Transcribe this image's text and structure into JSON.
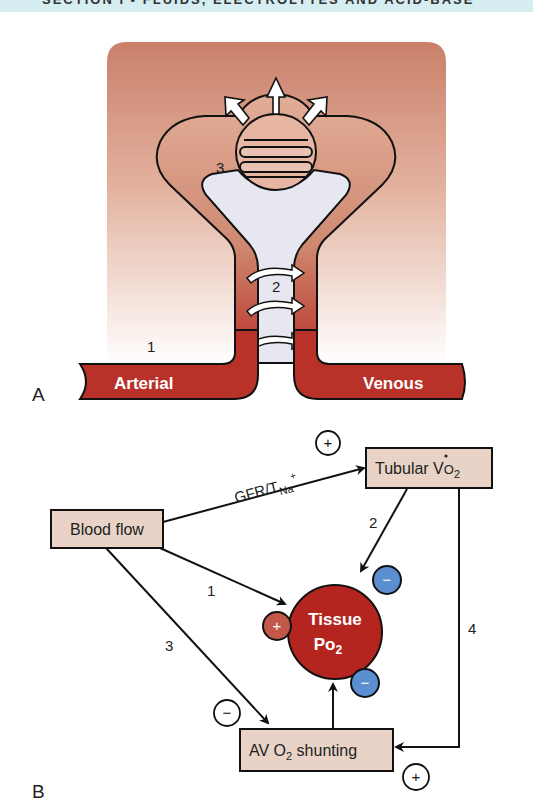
{
  "header": {
    "text": "SECTION I   •   FLUIDS, ELECTROLYTES AND ACID-BASE"
  },
  "panel_a": {
    "label": "A",
    "numbers": {
      "one": "1",
      "two": "2",
      "three": "3"
    },
    "vessel_labels": {
      "arterial": "Arterial",
      "venous": "Venous"
    },
    "colors": {
      "background_top": "#c9806a",
      "background_bottom": "#ffffff",
      "vessel": "#b8322a",
      "tubule_lumen": "#e6e6f0"
    }
  },
  "panel_b": {
    "label": "B",
    "nodes": {
      "blood_flow": "Blood flow",
      "tubular_vo2": {
        "main": "Tubular V",
        "sub_prefix": "O",
        "sub": "2"
      },
      "tissue_po2": {
        "line1": "Tissue",
        "line2_main": "Po",
        "line2_sub": "2"
      },
      "av_shunting": {
        "pre": "AV O",
        "sub": "2",
        "post": " shunting"
      }
    },
    "edges": {
      "gfr_label": {
        "main": "GFR/T",
        "sub": "Na",
        "sup": "+"
      },
      "path_1": "1",
      "path_2": "2",
      "path_3": "3",
      "path_4": "4"
    },
    "signs": {
      "gfr_sign": "+",
      "blood_flow_effect": "+",
      "tubular_effect": "−",
      "shunting_effect": "−",
      "path3_sign": "−",
      "path4_sign": "+"
    },
    "colors": {
      "node_fill": "#e8d3c6",
      "tissue_fill": "#b5251f",
      "positive_badge": "#c2574a",
      "negative_badge": "#5b8fd1"
    }
  }
}
